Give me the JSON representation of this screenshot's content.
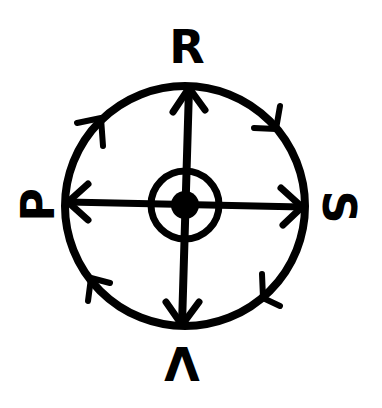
{
  "diagram": {
    "title": "",
    "background": "#ffffff",
    "stroke_color": "#000000",
    "labels": {
      "top": "R",
      "right": "S",
      "bottom": "V",
      "left": "P"
    },
    "label_orientation": {
      "top": "upright",
      "right": "rotated 90deg clockwise",
      "bottom": "rotated 180deg",
      "left": "rotated 90deg counter-clockwise"
    },
    "outer_circle": {
      "direction": "clockwise",
      "arrow_count": 4
    },
    "spokes": [
      {
        "from": "center",
        "to": "R",
        "arrowhead": "outward"
      },
      {
        "from": "center",
        "to": "S",
        "arrowhead": "outward"
      },
      {
        "from": "center",
        "to": "V",
        "arrowhead": "outward"
      },
      {
        "from": "center",
        "to": "P",
        "arrowhead": "outward"
      }
    ],
    "center": {
      "symbol": "filled dot inside ring"
    }
  }
}
